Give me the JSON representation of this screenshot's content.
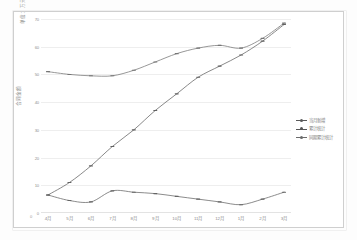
{
  "chart_data": {
    "type": "line",
    "title": "",
    "xlabel": "",
    "ylabel": "合同金额",
    "ylabel_top": "单位：\n万元",
    "ylim": [
      0,
      70
    ],
    "yticks": [
      0,
      10,
      20,
      30,
      40,
      50,
      60,
      70
    ],
    "grid": true,
    "legend_position": "right",
    "categories": [
      "4月",
      "5月",
      "6月",
      "7月",
      "8月",
      "9月",
      "10月",
      "11月",
      "12月",
      "1月",
      "2月",
      "3月"
    ],
    "series": [
      {
        "name": "当月新增",
        "color": "#5a5a5a",
        "values": [
          6.5,
          4.5,
          4.0,
          8.0,
          7.5,
          7.0,
          6.0,
          5.0,
          4.0,
          3.0,
          5.0,
          7.5
        ]
      },
      {
        "name": "累计统计",
        "color": "#555555",
        "values": [
          6.5,
          11.0,
          17.0,
          24.0,
          30.0,
          37.0,
          43.0,
          49.0,
          53.0,
          57.0,
          62.0,
          68.0
        ]
      },
      {
        "name": "同期累计统计",
        "color": "#6b6b6b",
        "values": [
          51.0,
          50.0,
          49.5,
          49.5,
          51.5,
          54.5,
          57.5,
          59.5,
          60.5,
          59.5,
          63.0,
          68.5
        ]
      }
    ]
  }
}
